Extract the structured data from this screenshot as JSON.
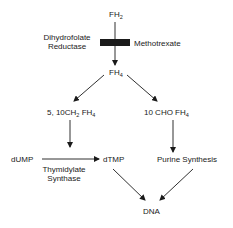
{
  "diagram": {
    "nodes": {
      "fh2": {
        "base": "FH",
        "sub": "2"
      },
      "fh4": {
        "base": "FH",
        "sub": "4"
      },
      "methylene": {
        "pre": "5, 10CH",
        "sub1": "2",
        "mid": " FH",
        "sub2": "4"
      },
      "formyl": {
        "pre": "10 CHO FH",
        "sub": "4"
      },
      "dump": "dUMP",
      "dtmp": "dTMP",
      "purine": "Purine Synthesis",
      "dna": "DNA"
    },
    "enzymes": {
      "dhfr_line1": "Dihydrofolate",
      "dhfr_line2": "Reductase",
      "ts_line1": "Thymidylate",
      "ts_line2": "Synthase"
    },
    "inhibitor": {
      "label": "Methotrexate",
      "block_color": "#1a1a1a"
    },
    "edges": [
      {
        "from": "FH2",
        "to": "FH4",
        "enzyme": "Dihydrofolate Reductase",
        "blocked_by": "Methotrexate"
      },
      {
        "from": "FH4",
        "to": "5, 10CH2 FH4"
      },
      {
        "from": "FH4",
        "to": "10 CHO FH4"
      },
      {
        "from": "5, 10CH2 FH4",
        "to": "dUMP→dTMP"
      },
      {
        "from": "dUMP",
        "to": "dTMP",
        "enzyme": "Thymidylate Synthase"
      },
      {
        "from": "10 CHO FH4",
        "to": "Purine Synthesis"
      },
      {
        "from": "dTMP",
        "to": "DNA"
      },
      {
        "from": "Purine Synthesis",
        "to": "DNA"
      }
    ]
  }
}
